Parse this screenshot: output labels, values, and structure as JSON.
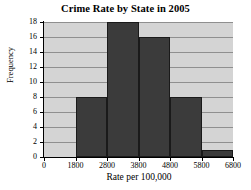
{
  "chart_data": {
    "type": "bar",
    "title": "Crime Rate by State in 2005",
    "xlabel": "Rate per 100,000",
    "ylabel": "Frequency",
    "bin_edges": [
      1800,
      2800,
      3800,
      4800,
      5800,
      6800
    ],
    "categories": [
      "1800-2800",
      "2800-3800",
      "3800-4800",
      "4800-5800",
      "5800-6800"
    ],
    "values": [
      8,
      18,
      16,
      8,
      1
    ],
    "xticks": [
      "0",
      "1800",
      "2800",
      "3800",
      "4800",
      "5800",
      "6800"
    ],
    "xtick_values": [
      0,
      1800,
      2800,
      3800,
      4800,
      5800,
      6800
    ],
    "yticks": [
      "0",
      "2",
      "4",
      "6",
      "8",
      "10",
      "12",
      "14",
      "16",
      "18"
    ],
    "ytick_values": [
      0,
      2,
      4,
      6,
      8,
      10,
      12,
      14,
      16,
      18
    ],
    "ylim": [
      0,
      18
    ],
    "grid": "horizontal",
    "legend": "none",
    "colors": {
      "bar_fill": "#3b3b3b",
      "bar_edge": "#1a1a1a",
      "plot_background": "#d4d4d4",
      "gridline": "#8f8f8f",
      "axis": "#000000",
      "figure_background": "#ffffff",
      "text": "#000000"
    }
  }
}
